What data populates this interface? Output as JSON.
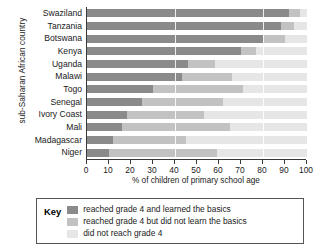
{
  "chart_data": {
    "type": "bar",
    "orientation": "horizontal",
    "stacked": true,
    "stacked_percent": true,
    "title": "",
    "xlabel": "% of children of primary school age",
    "ylabel": "sub-Saharan African country",
    "xlim": [
      0,
      100
    ],
    "xticks": [
      0,
      10,
      20,
      30,
      40,
      50,
      60,
      70,
      80,
      90,
      100
    ],
    "grid": false,
    "legend_position": "below-plot",
    "categories": [
      "Swaziland",
      "Tanzania",
      "Botswana",
      "Kenya",
      "Uganda",
      "Malawi",
      "Togo",
      "Senegal",
      "Ivory Coast",
      "Mali",
      "Madagascar",
      "Niger"
    ],
    "series": [
      {
        "name": "reached grade 4 and learned the basics",
        "color": "#8a8a8a",
        "values": [
          92,
          88,
          80,
          70,
          46,
          43,
          30,
          25,
          18,
          16,
          12,
          10
        ]
      },
      {
        "name": "reached grade 4 but did not learn the basics",
        "color": "#c2c2c2",
        "values": [
          5,
          6,
          10,
          7,
          12,
          23,
          41,
          37,
          35,
          49,
          33,
          49
        ]
      },
      {
        "name": "did not reach grade 4",
        "color": "#e6e6e6",
        "values": [
          3,
          6,
          10,
          23,
          42,
          34,
          29,
          38,
          47,
          35,
          55,
          41
        ]
      }
    ]
  },
  "legend": {
    "title": "Key",
    "items": [
      {
        "label": "reached grade 4 and learned the basics",
        "color": "#8a8a8a"
      },
      {
        "label": "reached grade 4 but did not learn the basics",
        "color": "#c2c2c2"
      },
      {
        "label": "did not reach grade 4",
        "color": "#e6e6e6"
      }
    ]
  }
}
